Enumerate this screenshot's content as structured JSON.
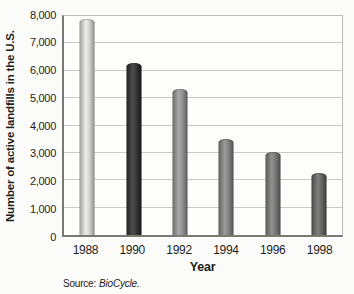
{
  "chart_data": {
    "type": "bar",
    "title": "",
    "categories": [
      "1988",
      "1990",
      "1992",
      "1994",
      "1996",
      "1998"
    ],
    "values": [
      7900,
      6300,
      5350,
      3500,
      3050,
      2250
    ],
    "xlabel": "Year",
    "ylabel": "Number of active landfills in the U.S.",
    "ylim": [
      0,
      8000
    ],
    "ytick_step": 1000,
    "ytick_labels": [
      "0",
      "1,000",
      "2,000",
      "3,000",
      "4,000",
      "5,000",
      "6,000",
      "7,000",
      "8,000"
    ],
    "grid": true,
    "legend_position": "none",
    "source": {
      "prefix": "Source:",
      "name": "BioCycle."
    },
    "bar_gradients": [
      [
        "#a2a29c",
        "#eeeee8",
        "#d2d2cc",
        "#8e8e88"
      ],
      [
        "#222222",
        "#4e4e4e",
        "#353535",
        "#161616"
      ],
      [
        "#6c6c6c",
        "#aaaaaa",
        "#8e8e8e",
        "#5c5c5c"
      ],
      [
        "#626262",
        "#9b9b9b",
        "#818181",
        "#535353"
      ],
      [
        "#5a5a5a",
        "#919191",
        "#777777",
        "#4c4c4c"
      ],
      [
        "#484848",
        "#7f7f7f",
        "#666666",
        "#3b3b3b"
      ]
    ],
    "colors": {
      "background": "#fbfbf9",
      "plot_bg": "#fdfdfc",
      "gridline": "#c9c9c5",
      "axis_line": "#7a7a74",
      "border_light": "#bcbcb8",
      "text": "#1d1d1b"
    }
  }
}
